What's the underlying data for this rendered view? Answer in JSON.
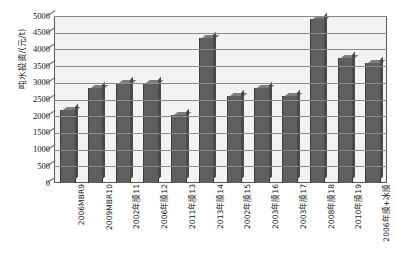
{
  "chart_data": {
    "type": "bar",
    "title": "",
    "subtitle": "",
    "xlabel": "",
    "ylabel": "吨水投资/(元/t)",
    "ylim": [
      0,
      5000
    ],
    "ytick_step": 500,
    "yticks": [
      "5000",
      "4500",
      "4000",
      "3500",
      "3000",
      "2500",
      "2000",
      "1500",
      "1000",
      "500",
      "0"
    ],
    "grid": true,
    "legend": "none",
    "bar_color": "#5f5f5f",
    "plot_background": "#f2f2f0",
    "categories": [
      "2006MBR9",
      "2009MBR10",
      "2002年膜11",
      "2006年膜12",
      "2011年膜13",
      "2013年膜14",
      "2002年膜15",
      "2003年膜16",
      "2003年膜17",
      "2008年膜18",
      "2010年膜19",
      "2006年膜+冰膜"
    ],
    "values": [
      2200,
      2850,
      3000,
      3000,
      2050,
      4350,
      2600,
      2850,
      2600,
      4900,
      3750,
      3600
    ]
  }
}
